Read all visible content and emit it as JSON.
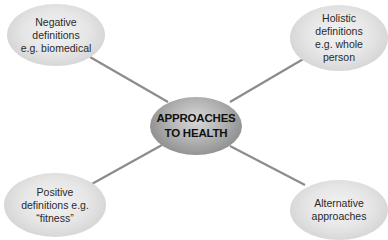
{
  "diagram": {
    "center": {
      "lines": [
        "APPROACHES",
        "TO HEALTH"
      ]
    },
    "nodes": [
      {
        "id": "negative",
        "lines": [
          "Negative",
          "definitions",
          "e.g. biomedical"
        ]
      },
      {
        "id": "holistic",
        "lines": [
          "Holistic",
          "definitions",
          "e.g. whole",
          "person"
        ]
      },
      {
        "id": "positive",
        "lines": [
          "Positive",
          "definitions e.g.",
          "“fitness”"
        ]
      },
      {
        "id": "alternative",
        "lines": [
          "Alternative",
          "approaches"
        ]
      }
    ],
    "colors": {
      "connector": "#8c8c8c",
      "outer_node_fill": "#e2e2e2",
      "center_node_fill": "#9a9a9a",
      "text": "#2a2a2a"
    }
  }
}
